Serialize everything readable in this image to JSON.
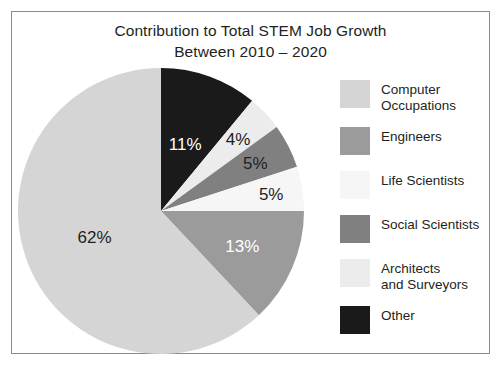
{
  "title": {
    "line1": "Contribution to Total STEM Job Growth",
    "line2": "Between 2010 – 2020"
  },
  "chart_data": {
    "type": "pie",
    "title": "Contribution to Total STEM Job Growth Between 2010 – 2020",
    "xlabel": "",
    "ylabel": "",
    "legend_position": "right",
    "grid": false,
    "start_angle_deg": 0,
    "direction": "clockwise",
    "categories": [
      "Computer Occupations",
      "Engineers",
      "Life Scientists",
      "Social Scientists",
      "Architects and Surveyors",
      "Other"
    ],
    "values": [
      62,
      13,
      5,
      5,
      4,
      11
    ],
    "units": "percent",
    "colors": [
      "#d5d5d5",
      "#9b9b9b",
      "#f6f6f6",
      "#808080",
      "#ececec",
      "#1a1a1a"
    ],
    "slices": [
      {
        "name": "Other",
        "value": 11,
        "label": "11%",
        "color": "#1a1a1a",
        "label_color": "#ffffff",
        "order": 1
      },
      {
        "name": "Architects and Surveyors",
        "value": 4,
        "label": "4%",
        "color": "#ececec",
        "label_color": "#231f20",
        "order": 2
      },
      {
        "name": "Social Scientists",
        "value": 5,
        "label": "5%",
        "color": "#808080",
        "label_color": "#231f20",
        "order": 3
      },
      {
        "name": "Life Scientists",
        "value": 5,
        "label": "5%",
        "color": "#f6f6f6",
        "label_color": "#231f20",
        "order": 4
      },
      {
        "name": "Engineers",
        "value": 13,
        "label": "13%",
        "color": "#9b9b9b",
        "label_color": "#ffffff",
        "order": 5
      },
      {
        "name": "Computer Occupations",
        "value": 62,
        "label": "62%",
        "color": "#d5d5d5",
        "label_color": "#231f20",
        "order": 6
      }
    ]
  },
  "legend": {
    "items": [
      {
        "label": "Computer\nOccupations",
        "color": "#d5d5d5"
      },
      {
        "label": "Engineers",
        "color": "#9b9b9b"
      },
      {
        "label": "Life Scientists",
        "color": "#f6f6f6"
      },
      {
        "label": "Social Scientists",
        "color": "#808080"
      },
      {
        "label": "Architects\nand Surveyors",
        "color": "#ececec"
      },
      {
        "label": "Other",
        "color": "#1a1a1a"
      }
    ]
  }
}
